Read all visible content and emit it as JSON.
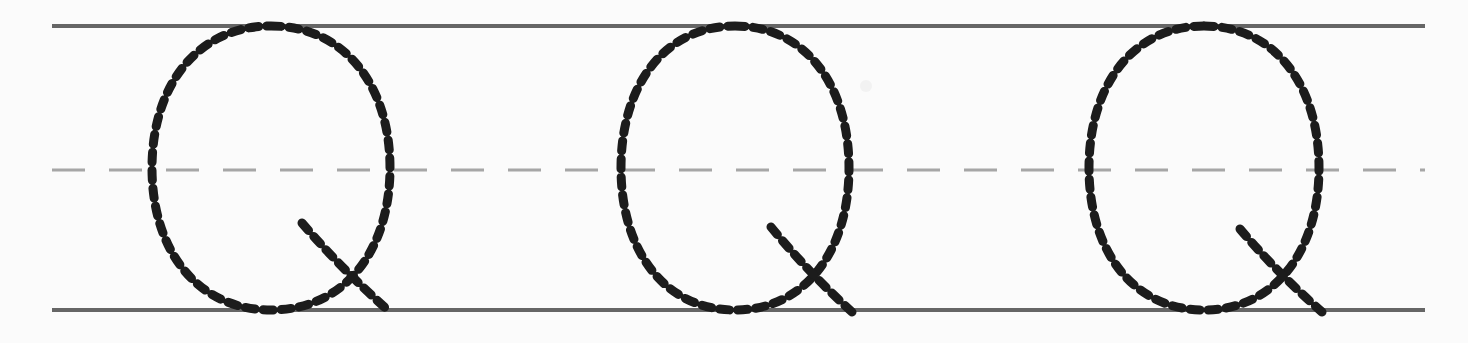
{
  "worksheet": {
    "title": "Cursive capital Q tracing practice row",
    "letter": "Q",
    "script_style": "cursive-capital",
    "repetitions": 3,
    "page_width": 1468,
    "page_height": 343,
    "background_color": "#fbfbfb",
    "paper_artifact_present": true
  },
  "guidelines": {
    "top_line": {
      "name": "top-solid-line",
      "y": 26,
      "x_start": 52,
      "x_end": 1425,
      "color": "#666666",
      "thickness": 4,
      "style": "solid"
    },
    "mid_line": {
      "name": "midline-dashed",
      "y": 170,
      "x_start": 52,
      "x_end": 1425,
      "color": "#a6a6a6",
      "thickness": 3,
      "style": "dashed",
      "dash_length": 33,
      "dash_gap": 24
    },
    "bottom_line": {
      "name": "bottom-solid-line",
      "y": 310,
      "x_start": 52,
      "x_end": 1425,
      "color": "#666666",
      "thickness": 4,
      "style": "solid"
    }
  },
  "trace_style": {
    "color": "#1c1c1c",
    "stroke_width": 9,
    "dash_length": 10,
    "dash_gap": 8
  },
  "letters": [
    {
      "name": "letter-q-1",
      "index": 1,
      "glyph": "Q",
      "bowl": {
        "center_x": 271,
        "center_y": 168,
        "radius_x": 119,
        "radius_y": 142
      },
      "tail": {
        "start_x": 302,
        "start_y": 223,
        "end_x": 390,
        "end_y": 312
      }
    },
    {
      "name": "letter-q-2",
      "index": 2,
      "glyph": "Q",
      "bowl": {
        "center_x": 735,
        "center_y": 168,
        "radius_x": 114,
        "radius_y": 142
      },
      "tail": {
        "start_x": 771,
        "start_y": 227,
        "end_x": 852,
        "end_y": 312
      }
    },
    {
      "name": "letter-q-3",
      "index": 3,
      "glyph": "Q",
      "bowl": {
        "center_x": 1204,
        "center_y": 168,
        "radius_x": 115,
        "radius_y": 142
      },
      "tail": {
        "start_x": 1240,
        "start_y": 229,
        "end_x": 1322,
        "end_y": 312
      }
    }
  ],
  "artifacts": [
    {
      "name": "paper-speck",
      "x": 866,
      "y": 86,
      "radius": 6
    }
  ]
}
